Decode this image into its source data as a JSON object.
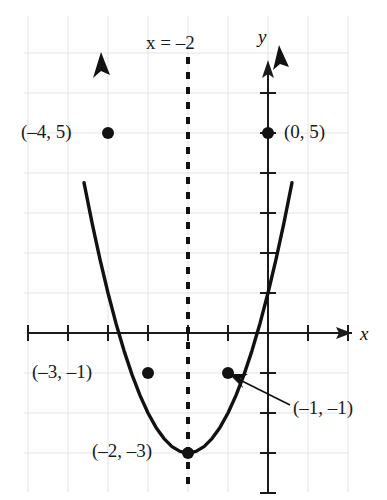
{
  "chart_data": {
    "type": "line",
    "title": "",
    "subtitle": "",
    "xlabel": "x",
    "ylabel": "y",
    "xlim": [
      -6.6,
      3.0
    ],
    "ylim": [
      -4.2,
      7.1
    ],
    "grid": true,
    "legend": null,
    "function": "y = (x + 2)^2 - 3",
    "curve_description": "upward-opening parabola with vertex at (-2, -3)",
    "x": [
      -4.6,
      -4.4,
      -4.2,
      -4.0,
      -3.8,
      -3.6,
      -3.4,
      -3.2,
      -3.0,
      -2.8,
      -2.6,
      -2.4,
      -2.2,
      -2.0,
      -1.8,
      -1.6,
      -1.4,
      -1.2,
      -1.0,
      -0.8,
      -0.6,
      -0.4,
      -0.2,
      0.0,
      0.2,
      0.4,
      0.6
    ],
    "values": [
      3.76,
      2.76,
      1.84,
      1.0,
      0.24,
      -0.44,
      -1.04,
      -1.56,
      -2.0,
      -2.36,
      -2.64,
      -2.84,
      -2.96,
      -3.0,
      -2.96,
      -2.84,
      -2.64,
      -2.36,
      -2.0,
      -1.56,
      -1.04,
      -0.44,
      0.24,
      1.0,
      1.84,
      2.76,
      3.76
    ],
    "x_ticks": [
      -6,
      -5,
      -4,
      -3,
      -2,
      -1,
      1,
      2
    ],
    "y_ticks": [
      -4,
      -3,
      -2,
      -1,
      1,
      2,
      3,
      4,
      5,
      6
    ],
    "points": [
      {
        "id": "p-n4-5",
        "label": "(–4, 5)",
        "x": -4,
        "y": 5,
        "label_side": "left"
      },
      {
        "id": "p-0-5",
        "label": "(0, 5)",
        "x": 0,
        "y": 5,
        "label_side": "right"
      },
      {
        "id": "p-n3-n1",
        "label": "(–3, –1)",
        "x": -3,
        "y": -1,
        "label_side": "left"
      },
      {
        "id": "p-n1-n1",
        "label": "(–1, –1)",
        "x": -1,
        "y": -1,
        "label_side": "callout"
      },
      {
        "id": "p-n2-n3",
        "label": "(–2, –3)",
        "x": -2,
        "y": -3,
        "label_side": "left"
      }
    ],
    "annotations": [
      {
        "id": "axis-of-symmetry",
        "label": "x = –2",
        "type": "vertical-dashed-line",
        "x": -2
      }
    ],
    "colors": {
      "curve": "#111111",
      "axis": "#1a1a1a",
      "grid": "#dfe3ea",
      "point": "#111111",
      "text": "#1a1a1a",
      "background": "#ffffff"
    }
  },
  "labels": {
    "axis_x": "x",
    "axis_y": "y",
    "symmetry": "x = –2",
    "pt_neg4_5": "(–4, 5)",
    "pt_0_5": "(0, 5)",
    "pt_neg3_neg1": "(–3, –1)",
    "pt_neg1_neg1": "(–1, –1)",
    "pt_neg2_neg3": "(–2, –3)"
  }
}
